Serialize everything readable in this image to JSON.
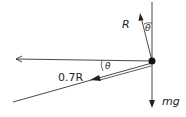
{
  "diagram": {
    "type": "free-body force diagram",
    "forces": [
      {
        "name": "normal-reaction",
        "label": "R",
        "angle_label": "θ"
      },
      {
        "name": "friction",
        "label": "0.7R",
        "angle_label": "θ"
      },
      {
        "name": "weight",
        "label": "mg"
      },
      {
        "name": "horizontal-direction",
        "label": ""
      }
    ],
    "labels": {
      "R": "R",
      "theta_top": "θ",
      "friction": "0.7R",
      "theta_left": "θ",
      "weight": "mg"
    },
    "colors": {
      "line": "#333333",
      "point": "#111111"
    }
  }
}
